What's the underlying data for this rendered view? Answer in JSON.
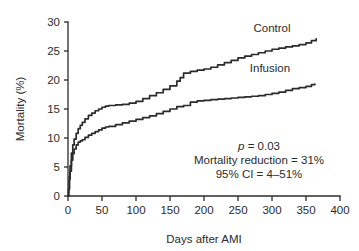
{
  "chart_data": {
    "type": "line",
    "title": "",
    "xlabel": "Days after AMI",
    "ylabel": "Mortality (%)",
    "xlim": [
      0,
      400
    ],
    "ylim": [
      0,
      30
    ],
    "xticks": [
      0,
      50,
      100,
      150,
      200,
      250,
      300,
      350,
      400
    ],
    "xtick_labels": [
      "0",
      "50",
      "100",
      "150",
      "200",
      "250",
      "300",
      "350",
      "400"
    ],
    "yticks": [
      0,
      5,
      10,
      15,
      20,
      25,
      30
    ],
    "ytick_labels": [
      "0",
      "5",
      "10",
      "15",
      "20",
      "25",
      "30"
    ],
    "grid": false,
    "legend_position": "inline-curve-labels",
    "series": [
      {
        "name": "Control",
        "label": "Control",
        "color": "#2b2b2b",
        "label_x": 300,
        "label_y": 28.2,
        "x": [
          0,
          1,
          2,
          3,
          5,
          7,
          9,
          12,
          15,
          18,
          21,
          25,
          30,
          35,
          40,
          45,
          50,
          55,
          60,
          70,
          80,
          90,
          100,
          110,
          120,
          130,
          140,
          150,
          160,
          165,
          170,
          180,
          190,
          200,
          210,
          220,
          230,
          240,
          250,
          260,
          270,
          280,
          290,
          300,
          310,
          320,
          330,
          340,
          350,
          358,
          365
        ],
        "y": [
          0.0,
          1.2,
          3.4,
          5.2,
          7.4,
          8.8,
          9.8,
          10.8,
          11.6,
          12.2,
          12.7,
          13.3,
          13.9,
          14.3,
          14.7,
          15.0,
          15.3,
          15.5,
          15.6,
          15.7,
          15.8,
          16.0,
          16.3,
          16.8,
          17.3,
          17.8,
          18.4,
          19.0,
          19.8,
          20.4,
          21.2,
          21.5,
          21.7,
          21.9,
          22.2,
          22.6,
          23.0,
          23.4,
          23.8,
          24.1,
          24.4,
          24.7,
          25.0,
          25.3,
          25.5,
          25.7,
          25.9,
          26.1,
          26.4,
          26.8,
          27.1
        ]
      },
      {
        "name": "Infusion",
        "label": "Infusion",
        "color": "#2b2b2b",
        "label_x": 297,
        "label_y": 21.4,
        "x": [
          0,
          1,
          2,
          3,
          5,
          7,
          9,
          12,
          15,
          18,
          21,
          25,
          30,
          35,
          40,
          45,
          50,
          55,
          60,
          70,
          80,
          90,
          100,
          110,
          120,
          130,
          140,
          150,
          160,
          170,
          180,
          190,
          200,
          210,
          220,
          230,
          240,
          250,
          260,
          270,
          280,
          290,
          300,
          310,
          320,
          330,
          340,
          350,
          358,
          363
        ],
        "y": [
          0.0,
          1.1,
          2.8,
          4.3,
          6.2,
          7.3,
          8.1,
          8.8,
          9.3,
          9.5,
          9.7,
          10.1,
          10.5,
          10.8,
          11.1,
          11.4,
          11.7,
          11.9,
          12.0,
          12.3,
          12.6,
          12.9,
          13.2,
          13.5,
          13.8,
          14.2,
          14.6,
          15.0,
          15.4,
          15.6,
          16.2,
          16.4,
          16.5,
          16.6,
          16.7,
          16.8,
          16.9,
          17.0,
          17.1,
          17.2,
          17.3,
          17.5,
          17.7,
          17.9,
          18.2,
          18.5,
          18.7,
          18.9,
          19.2,
          19.3
        ]
      }
    ],
    "annotations": [
      {
        "text_italic": "p",
        "text": " = 0.03"
      },
      {
        "text_italic": "",
        "text": "Mortality reduction = 31%"
      },
      {
        "text_italic": "",
        "text": "95% CI = 4–51%"
      }
    ],
    "annotation_lines": [
      "p = 0.03",
      "Mortality reduction = 31%",
      "95% CI = 4–51%"
    ],
    "colors": {
      "axis": "#2b2b2b",
      "text": "#2b2b2b",
      "curve": "#2b2b2b",
      "background": "#ffffff"
    }
  }
}
